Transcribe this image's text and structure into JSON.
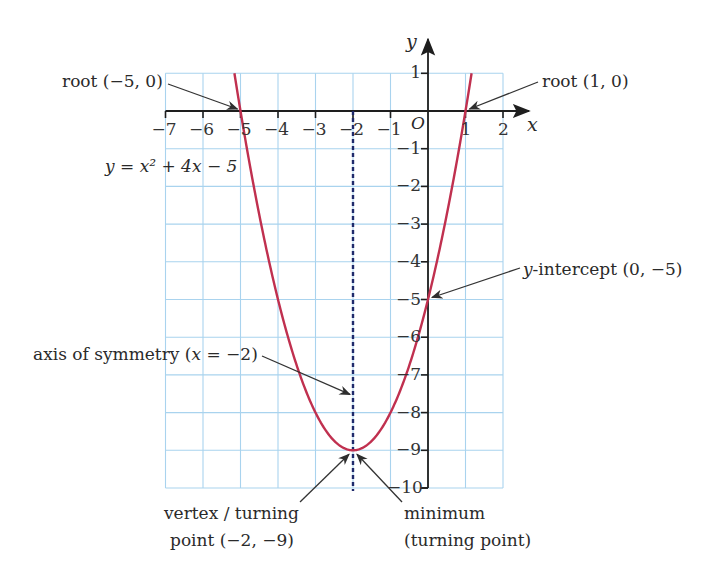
{
  "chart_data": {
    "type": "line",
    "title": "",
    "equation": "y = x² + 4x − 5",
    "xlabel": "x",
    "ylabel": "y",
    "origin_label": "O",
    "xlim": [
      -7,
      2
    ],
    "ylim": [
      -10,
      1
    ],
    "grid": true,
    "x_ticks": [
      -7,
      -6,
      -5,
      -4,
      -3,
      -2,
      -1,
      1,
      2
    ],
    "x_tick_labels": [
      "−7",
      "−6",
      "−5",
      "−4",
      "−3",
      "−2",
      "−1",
      "1",
      "2"
    ],
    "y_ticks": [
      1,
      -1,
      -2,
      -3,
      -4,
      -5,
      -6,
      -7,
      -8,
      -9,
      -10
    ],
    "y_tick_labels": [
      "1",
      "−1",
      "−2",
      "−3",
      "−4",
      "−5",
      "−6",
      "−7",
      "−8",
      "−9",
      "−10"
    ],
    "series": [
      {
        "name": "y = x² + 4x − 5",
        "color": "#c0304f",
        "x": [
          -5.24,
          -5,
          -4.5,
          -4,
          -3.5,
          -3,
          -2.5,
          -2,
          -1.5,
          -1,
          -0.5,
          0,
          0.5,
          1,
          1.24
        ],
        "y": [
          1,
          0,
          -2.75,
          -5,
          -6.75,
          -8,
          -8.75,
          -9,
          -8.75,
          -8,
          -6.75,
          -5,
          -2.75,
          0,
          1
        ]
      }
    ],
    "axis_of_symmetry": {
      "x": -2,
      "style": "dashed",
      "color": "#1f2a6b"
    },
    "annotations": [
      {
        "text": "root (−5, 0)",
        "point": [
          -5,
          0
        ]
      },
      {
        "text": "root (1, 0)",
        "point": [
          1,
          0
        ]
      },
      {
        "text": "y-intercept (0, −5)",
        "point": [
          0,
          -5
        ]
      },
      {
        "text": "axis of symmetry (x = −2)",
        "point": [
          -2,
          -7.2
        ]
      },
      {
        "text": "vertex / turning point (−2, −9)",
        "point": [
          -2,
          -9
        ]
      },
      {
        "text": "minimum (turning point)",
        "point": [
          -2,
          -9
        ]
      }
    ]
  },
  "labels": {
    "equation": "y = x² + 4x − 5",
    "root_left": "root (−5, 0)",
    "root_right": "root (1, 0)",
    "y_intercept_italic": "y",
    "y_intercept_rest": "-intercept (0, −5)",
    "axis_sym_pre": "axis of symmetry (",
    "axis_sym_x": "x",
    "axis_sym_post": " = −2)",
    "vertex_line1": "vertex / turning",
    "vertex_line2": "point (−2, −9)",
    "minimum_line1": "minimum",
    "minimum_line2": "(turning point)",
    "x_axis_label": "x",
    "y_axis_label": "y",
    "origin": "O"
  },
  "colors": {
    "grid": "#a9d3ee",
    "curve": "#c0304f",
    "axis": "#1e1e1e",
    "symmetry": "#1f2a6b",
    "arrow": "#333333"
  }
}
